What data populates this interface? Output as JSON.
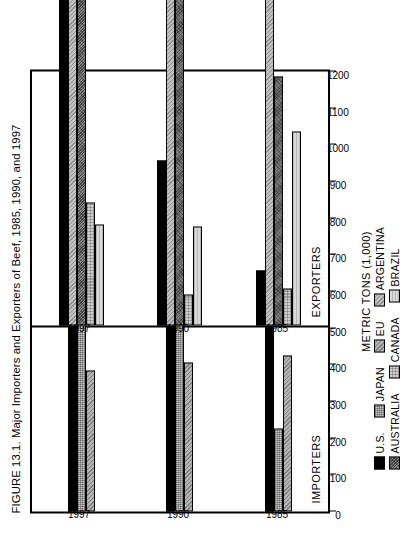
{
  "figure": {
    "title": "FIGURE 13.1. Major Importers and Exporters of Beef, 1985, 1990, and 1997",
    "axis_title": "METRIC TONS (1,000)",
    "panel_importers_label": "IMPORTERS",
    "panel_exporters_label": "EXPORTERS"
  },
  "chart_data": {
    "type": "bar",
    "title": "FIGURE 13.1. Major Importers and Exporters of Beef, 1985, 1990, and 1997",
    "orientation": "horizontal",
    "xlabel": "",
    "ylabel": "METRIC TONS (1,000)",
    "ylim": [
      0,
      1200
    ],
    "tick_labels": [
      "0",
      "100",
      "200",
      "300",
      "400",
      "500",
      "600",
      "700",
      "800",
      "900",
      "1000",
      "1100",
      "1200"
    ],
    "tick_values": [
      0,
      100,
      200,
      300,
      400,
      500,
      600,
      700,
      800,
      900,
      1000,
      1100,
      1200
    ],
    "grid": false,
    "legend_position": "bottom",
    "categories": [
      "1985",
      "1990",
      "1997"
    ],
    "panels": [
      {
        "name": "IMPORTERS",
        "series": [
          {
            "name": "U.S.",
            "color": "#000000",
            "pattern": "solid-black",
            "values": [
              950,
              1075,
              1070
            ]
          },
          {
            "name": "JAPAN",
            "color": "#c9c9c9",
            "pattern": "fine-dot",
            "values": [
              225,
              540,
              925
            ]
          },
          {
            "name": "EU",
            "color": "#b4b4b4",
            "pattern": "diagonal-hatch",
            "values": [
              425,
              405,
              385
            ]
          }
        ]
      },
      {
        "name": "EXPORTERS",
        "series": [
          {
            "name": "U.S.",
            "color": "#000000",
            "pattern": "solid-black",
            "values": [
              150,
              450,
              945
            ]
          },
          {
            "name": "ARGENTINA",
            "color": "#c2c2c2",
            "pattern": "diagonal-hatch",
            "values": [
              905,
              1105,
              900
            ]
          },
          {
            "name": "AUSTRALIA",
            "color": "#8a8a8a",
            "pattern": "dark-crosshatch",
            "values": [
              680,
              1070,
              1120
            ]
          },
          {
            "name": "CANADA",
            "color": "#cfcfcf",
            "pattern": "light-grid",
            "values": [
              100,
              85,
              335
            ]
          },
          {
            "name": "BRAZIL",
            "color": "#d9d9d9",
            "pattern": "very-light",
            "values": [
              530,
              270,
              275
            ]
          }
        ]
      }
    ],
    "legend": [
      {
        "label": "U.S.",
        "swatch": "f-us"
      },
      {
        "label": "JAPAN",
        "swatch": "f-japan"
      },
      {
        "label": "EU",
        "swatch": "f-eu"
      },
      {
        "label": "ARGENTINA",
        "swatch": "f-argentina"
      },
      {
        "label": "AUSTRALIA",
        "swatch": "f-australia"
      },
      {
        "label": "CANADA",
        "swatch": "f-canada"
      },
      {
        "label": "BRAZIL",
        "swatch": "f-brazil"
      }
    ]
  }
}
